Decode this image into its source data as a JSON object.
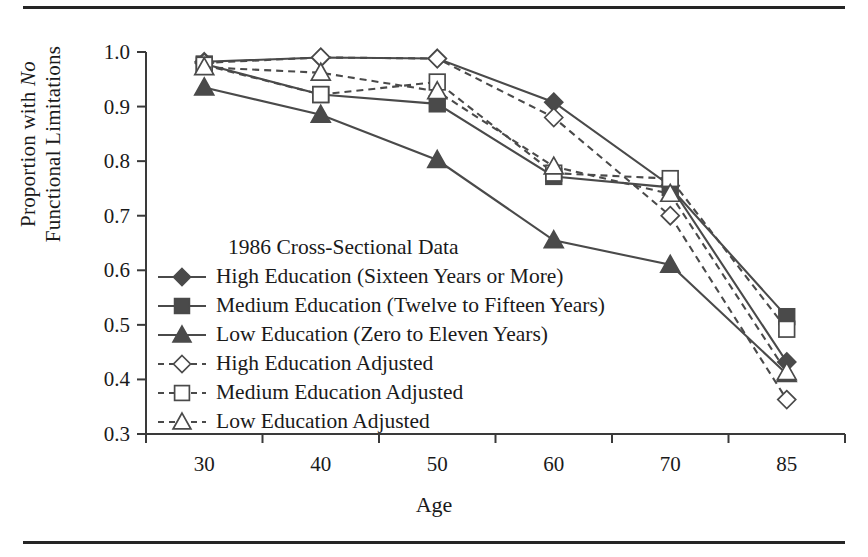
{
  "figure": {
    "top_rule": "horizontal-rule",
    "bottom_rule": "horizontal-rule"
  },
  "chart_data": {
    "type": "line",
    "title": "",
    "legend_title": "1986 Cross-Sectional Data",
    "legend_position": "inside-lower-left",
    "xlabel": "Age",
    "ylabel_line1": "Proportion with ",
    "ylabel_italic": "No",
    "ylabel_line2": "Functional Limitations",
    "grid": false,
    "categories": [
      "30",
      "40",
      "50",
      "60",
      "70",
      "85"
    ],
    "xtick_labels": [
      "30",
      "40",
      "50",
      "60",
      "70",
      "85"
    ],
    "ytick_labels": [
      "1.0",
      "0.9",
      "0.8",
      "0.7",
      "0.6",
      "0.5",
      "0.4",
      "0.3"
    ],
    "ytick_values": [
      1.0,
      0.9,
      0.8,
      0.7,
      0.6,
      0.5,
      0.4,
      0.3
    ],
    "ylim": [
      0.3,
      1.0
    ],
    "series": [
      {
        "name": "High Education (Sixteen Years or More)",
        "marker": "filled-diamond",
        "line": "solid",
        "color": "#4a4a4a",
        "values": [
          0.982,
          0.99,
          0.988,
          0.908,
          0.755,
          0.432
        ]
      },
      {
        "name": "Medium Education (Twelve to Fifteen Years)",
        "marker": "filled-square",
        "line": "solid",
        "color": "#4a4a4a",
        "values": [
          0.978,
          0.922,
          0.905,
          0.772,
          0.752,
          0.515
        ]
      },
      {
        "name": "Low Education (Zero to Eleven Years)",
        "marker": "filled-triangle",
        "line": "solid",
        "color": "#4a4a4a",
        "values": [
          0.935,
          0.885,
          0.802,
          0.655,
          0.61,
          0.41
        ]
      },
      {
        "name": "High Education Adjusted",
        "marker": "open-diamond",
        "line": "dashed",
        "color": "#4a4a4a",
        "values": [
          0.98,
          0.99,
          0.988,
          0.88,
          0.7,
          0.363
        ]
      },
      {
        "name": "Medium Education Adjusted",
        "marker": "open-square",
        "line": "dashed",
        "color": "#4a4a4a",
        "values": [
          0.976,
          0.922,
          0.945,
          0.778,
          0.768,
          0.492
        ]
      },
      {
        "name": "Low Education Adjusted",
        "marker": "open-triangle",
        "line": "dashed",
        "color": "#4a4a4a",
        "values": [
          0.972,
          0.962,
          0.928,
          0.79,
          0.74,
          0.413
        ]
      }
    ]
  }
}
